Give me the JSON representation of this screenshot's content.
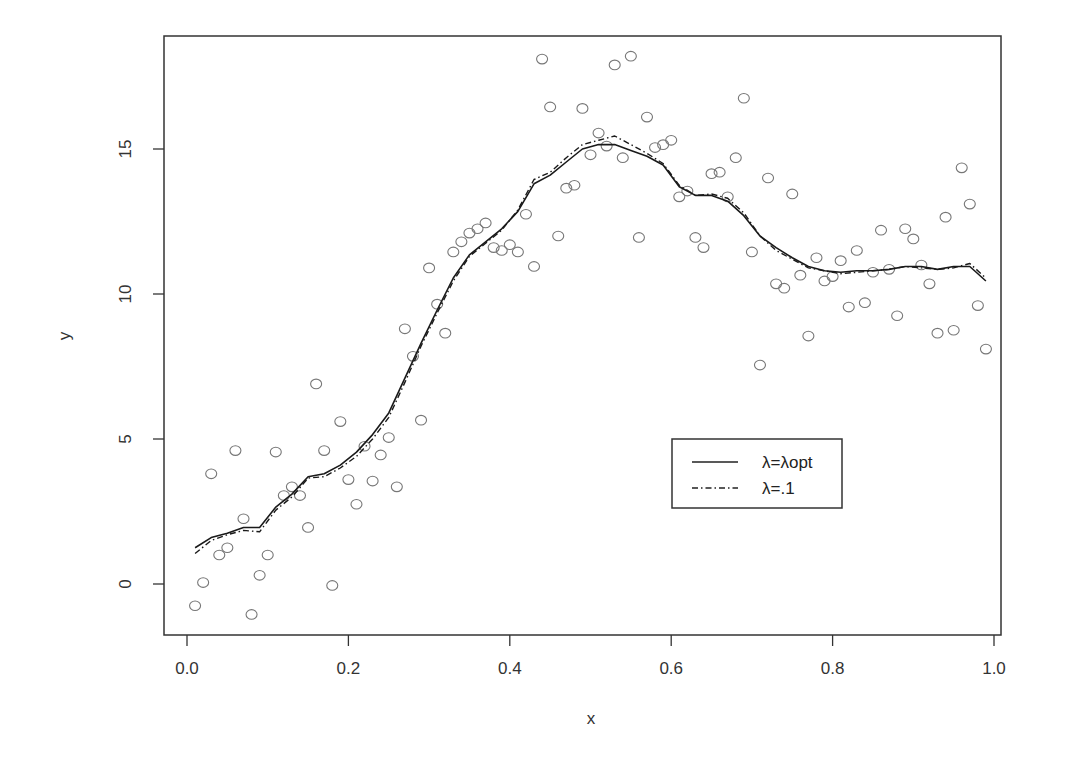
{
  "chart_data": {
    "type": "scatter",
    "title": "",
    "xlabel": "x",
    "ylabel": "y",
    "xlim": [
      -0.03,
      1.03
    ],
    "ylim": [
      -1.8,
      18.7
    ],
    "grid": false,
    "x_ticks": [
      0.0,
      0.2,
      0.4,
      0.6,
      0.8,
      1.0
    ],
    "x_tick_labels": [
      "0.0",
      "0.2",
      "0.4",
      "0.6",
      "0.8",
      "1.0"
    ],
    "y_ticks": [
      0,
      5,
      10,
      15
    ],
    "y_tick_labels": [
      "0",
      "5",
      "10",
      "15"
    ],
    "legend": {
      "position": "lower right (inside)",
      "entries": [
        {
          "label": "λ=λopt",
          "style": "solid"
        },
        {
          "label": "λ=.1",
          "style": "dash-dot"
        }
      ]
    },
    "scatter": {
      "name": "observations",
      "marker": "open circle",
      "points": [
        [
          0.01,
          -0.75
        ],
        [
          0.02,
          0.05
        ],
        [
          0.03,
          3.8
        ],
        [
          0.04,
          1.0
        ],
        [
          0.05,
          1.25
        ],
        [
          0.06,
          4.6
        ],
        [
          0.07,
          2.25
        ],
        [
          0.08,
          -1.05
        ],
        [
          0.09,
          0.3
        ],
        [
          0.1,
          1.0
        ],
        [
          0.11,
          4.55
        ],
        [
          0.12,
          3.05
        ],
        [
          0.13,
          3.35
        ],
        [
          0.14,
          3.05
        ],
        [
          0.15,
          1.95
        ],
        [
          0.16,
          6.9
        ],
        [
          0.17,
          4.6
        ],
        [
          0.18,
          -0.05
        ],
        [
          0.19,
          5.6
        ],
        [
          0.2,
          3.6
        ],
        [
          0.21,
          2.75
        ],
        [
          0.22,
          4.75
        ],
        [
          0.23,
          3.55
        ],
        [
          0.24,
          4.45
        ],
        [
          0.25,
          5.05
        ],
        [
          0.26,
          3.35
        ],
        [
          0.27,
          8.8
        ],
        [
          0.28,
          7.85
        ],
        [
          0.29,
          5.65
        ],
        [
          0.3,
          10.9
        ],
        [
          0.31,
          9.65
        ],
        [
          0.32,
          8.65
        ],
        [
          0.33,
          11.45
        ],
        [
          0.34,
          11.8
        ],
        [
          0.35,
          12.1
        ],
        [
          0.36,
          12.25
        ],
        [
          0.37,
          12.45
        ],
        [
          0.38,
          11.6
        ],
        [
          0.39,
          11.5
        ],
        [
          0.4,
          11.7
        ],
        [
          0.41,
          11.45
        ],
        [
          0.42,
          12.75
        ],
        [
          0.43,
          10.95
        ],
        [
          0.44,
          18.1
        ],
        [
          0.45,
          16.45
        ],
        [
          0.46,
          12.0
        ],
        [
          0.47,
          13.65
        ],
        [
          0.48,
          13.75
        ],
        [
          0.49,
          16.4
        ],
        [
          0.5,
          14.8
        ],
        [
          0.51,
          15.55
        ],
        [
          0.52,
          15.1
        ],
        [
          0.53,
          17.9
        ],
        [
          0.54,
          14.7
        ],
        [
          0.55,
          18.2
        ],
        [
          0.56,
          11.95
        ],
        [
          0.57,
          16.1
        ],
        [
          0.58,
          15.05
        ],
        [
          0.59,
          15.15
        ],
        [
          0.6,
          15.3
        ],
        [
          0.61,
          13.35
        ],
        [
          0.62,
          13.55
        ],
        [
          0.63,
          11.95
        ],
        [
          0.64,
          11.6
        ],
        [
          0.65,
          14.15
        ],
        [
          0.66,
          14.2
        ],
        [
          0.67,
          13.35
        ],
        [
          0.68,
          14.7
        ],
        [
          0.69,
          16.75
        ],
        [
          0.7,
          11.45
        ],
        [
          0.71,
          7.55
        ],
        [
          0.72,
          14.0
        ],
        [
          0.73,
          10.35
        ],
        [
          0.74,
          10.2
        ],
        [
          0.75,
          13.45
        ],
        [
          0.76,
          10.65
        ],
        [
          0.77,
          8.55
        ],
        [
          0.78,
          11.25
        ],
        [
          0.79,
          10.45
        ],
        [
          0.8,
          10.6
        ],
        [
          0.81,
          11.15
        ],
        [
          0.82,
          9.55
        ],
        [
          0.83,
          11.5
        ],
        [
          0.84,
          9.7
        ],
        [
          0.85,
          10.75
        ],
        [
          0.86,
          12.2
        ],
        [
          0.87,
          10.85
        ],
        [
          0.88,
          9.25
        ],
        [
          0.89,
          12.25
        ],
        [
          0.9,
          11.9
        ],
        [
          0.91,
          11.0
        ],
        [
          0.92,
          10.35
        ],
        [
          0.93,
          8.65
        ],
        [
          0.94,
          12.65
        ],
        [
          0.95,
          8.75
        ],
        [
          0.96,
          14.35
        ],
        [
          0.97,
          13.1
        ],
        [
          0.98,
          9.6
        ],
        [
          0.99,
          8.1
        ]
      ]
    },
    "series": [
      {
        "name": "λ=λopt",
        "style": "solid",
        "x": [
          0.01,
          0.03,
          0.05,
          0.07,
          0.09,
          0.11,
          0.13,
          0.15,
          0.17,
          0.19,
          0.21,
          0.23,
          0.25,
          0.27,
          0.29,
          0.31,
          0.33,
          0.35,
          0.37,
          0.39,
          0.41,
          0.43,
          0.45,
          0.47,
          0.49,
          0.51,
          0.53,
          0.55,
          0.57,
          0.59,
          0.61,
          0.63,
          0.65,
          0.67,
          0.69,
          0.71,
          0.73,
          0.75,
          0.77,
          0.79,
          0.81,
          0.83,
          0.85,
          0.87,
          0.89,
          0.91,
          0.93,
          0.95,
          0.97,
          0.99
        ],
        "values": [
          1.25,
          1.6,
          1.75,
          1.95,
          1.95,
          2.65,
          3.1,
          3.7,
          3.8,
          4.1,
          4.55,
          5.15,
          5.9,
          7.1,
          8.3,
          9.45,
          10.55,
          11.35,
          11.8,
          12.25,
          12.85,
          13.8,
          14.1,
          14.55,
          15.0,
          15.15,
          15.15,
          14.95,
          14.75,
          14.45,
          13.7,
          13.4,
          13.4,
          13.2,
          12.7,
          12.0,
          11.6,
          11.25,
          10.95,
          10.8,
          10.75,
          10.8,
          10.8,
          10.85,
          10.95,
          10.95,
          10.85,
          10.95,
          10.95,
          10.45
        ]
      },
      {
        "name": "λ=.1",
        "style": "dash-dot",
        "x": [
          0.01,
          0.03,
          0.05,
          0.07,
          0.09,
          0.11,
          0.13,
          0.15,
          0.17,
          0.19,
          0.21,
          0.23,
          0.25,
          0.27,
          0.29,
          0.31,
          0.33,
          0.35,
          0.37,
          0.39,
          0.41,
          0.43,
          0.45,
          0.47,
          0.49,
          0.51,
          0.53,
          0.55,
          0.57,
          0.59,
          0.61,
          0.63,
          0.65,
          0.67,
          0.69,
          0.71,
          0.73,
          0.75,
          0.77,
          0.79,
          0.81,
          0.83,
          0.85,
          0.87,
          0.89,
          0.91,
          0.93,
          0.95,
          0.97,
          0.99
        ],
        "values": [
          1.05,
          1.5,
          1.7,
          1.85,
          1.8,
          2.55,
          3.0,
          3.65,
          3.7,
          4.0,
          4.4,
          5.0,
          5.75,
          6.95,
          8.2,
          9.35,
          10.45,
          11.3,
          11.75,
          12.2,
          12.9,
          13.95,
          14.2,
          14.7,
          15.15,
          15.3,
          15.45,
          15.15,
          14.85,
          14.5,
          13.75,
          13.4,
          13.45,
          13.3,
          12.8,
          12.0,
          11.5,
          11.2,
          10.9,
          10.8,
          10.7,
          10.75,
          10.8,
          10.85,
          10.95,
          10.9,
          10.85,
          10.9,
          11.05,
          10.55
        ]
      }
    ]
  }
}
